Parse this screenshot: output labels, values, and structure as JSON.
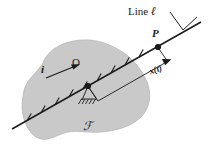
{
  "figure": {
    "kind": "kinematics-diagram",
    "caption_absent": true,
    "background_color": "#ffffff",
    "ink_color": "#1a1a1a",
    "body_fill_color": "#c9c9c9",
    "labels": {
      "line_label_prefix": "Line ",
      "line_label_symbol": "ℓ",
      "point_p": "P",
      "point_o": "O",
      "unit_vector_i": "i",
      "coordinate_x_of_t": "x(t)",
      "reference_frame": "ℱ"
    },
    "geometry": {
      "line_start": [
        12,
        129
      ],
      "line_end": [
        201,
        22
      ],
      "origin_point": [
        88,
        86
      ],
      "point_p": [
        158,
        47
      ],
      "leader_start": [
        170,
        12
      ],
      "leader_corner": [
        183,
        30
      ],
      "leader_end": [
        196,
        18
      ],
      "tick_count": 9,
      "dimension_from": [
        97,
        97
      ],
      "dimension_to": [
        168,
        57
      ]
    },
    "icons": {
      "unit_vector_arrow": "arrow-right-icon",
      "dimension_arrow": "arrow-head-icon",
      "ground_support": "hatched-ground-icon",
      "node_marker": "filled-dot-icon"
    }
  }
}
